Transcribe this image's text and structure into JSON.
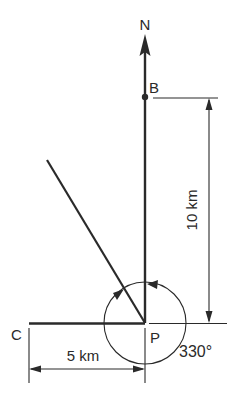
{
  "diagram": {
    "north_label": "N",
    "point_b_label": "B",
    "point_c_label": "C",
    "point_p_label": "P",
    "distance_pb_label": "10 km",
    "distance_cp_label": "5 km",
    "bearing_label": "330°",
    "line_color": "#2a2a2a",
    "background_color": "#ffffff"
  }
}
